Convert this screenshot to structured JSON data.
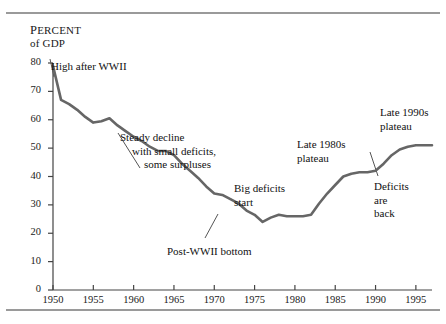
{
  "figure": {
    "axis_title_line1": "Percent",
    "axis_title_line2": "of GDP",
    "line_color": "#666666",
    "rule_color": "#9a9a9a",
    "axis_color": "#444444"
  },
  "chart_data": {
    "type": "line",
    "title": "",
    "subtitle": "",
    "xlabel": "",
    "ylabel": "Percent of GDP",
    "xlim": [
      1950,
      1997
    ],
    "ylim": [
      0,
      80
    ],
    "grid": false,
    "legend": "none",
    "yticks": [
      0,
      10,
      20,
      30,
      40,
      50,
      60,
      70,
      80
    ],
    "ytick_labels": [
      "0",
      "10",
      "20",
      "30",
      "40",
      "50",
      "60",
      "70",
      "80"
    ],
    "xticks": [
      1950,
      1955,
      1960,
      1965,
      1970,
      1975,
      1980,
      1985,
      1990,
      1995
    ],
    "xtick_labels": [
      "1950",
      "1955",
      "1960",
      "1965",
      "1970",
      "1975",
      "1980",
      "1985",
      "1990",
      "1995"
    ],
    "series": [
      {
        "name": "Federal debt held by the public as percent of GDP",
        "x": [
          1950,
          1951,
          1952,
          1953,
          1954,
          1955,
          1956,
          1957,
          1958,
          1959,
          1960,
          1961,
          1962,
          1963,
          1964,
          1965,
          1966,
          1967,
          1968,
          1969,
          1970,
          1971,
          1972,
          1973,
          1974,
          1975,
          1976,
          1977,
          1978,
          1979,
          1980,
          1981,
          1982,
          1983,
          1984,
          1985,
          1986,
          1987,
          1988,
          1989,
          1990,
          1991,
          1992,
          1993,
          1994,
          1995,
          1996,
          1997
        ],
        "values": [
          79.0,
          67.0,
          65.5,
          63.5,
          61.0,
          59.0,
          59.5,
          60.5,
          58.0,
          56.0,
          54.0,
          52.5,
          50.5,
          49.0,
          49.0,
          47.5,
          44.5,
          42.0,
          39.5,
          36.5,
          34.0,
          33.5,
          32.0,
          30.5,
          28.0,
          26.5,
          24.0,
          25.5,
          26.5,
          26.0,
          26.0,
          26.0,
          26.5,
          30.5,
          34.0,
          37.0,
          40.0,
          41.0,
          41.5,
          41.5,
          42.0,
          44.5,
          47.5,
          49.5,
          50.5,
          51.0,
          51.0,
          51.0
        ]
      }
    ],
    "annotations": [
      {
        "id": "high-after-wwii",
        "lines": [
          "High after WWII"
        ],
        "x_px": 51,
        "y_px": 60
      },
      {
        "id": "steady-decline",
        "lines": [
          "Steady decline",
          "with small deficits,",
          "some surpluses"
        ],
        "x_px": 120,
        "y_px": 131
      },
      {
        "id": "post-wwii-bottom",
        "lines": [
          "Post-WWII bottom"
        ],
        "x_px": 167,
        "y_px": 245
      },
      {
        "id": "big-deficits-start",
        "lines": [
          "Big deficits",
          "start"
        ],
        "x_px": 234,
        "y_px": 182
      },
      {
        "id": "late-1980s-plateau",
        "lines": [
          "Late 1980s",
          "plateau"
        ],
        "x_px": 297,
        "y_px": 138
      },
      {
        "id": "late-1990s-plateau",
        "lines": [
          "Late 1990s",
          "plateau"
        ],
        "x_px": 380,
        "y_px": 106
      },
      {
        "id": "deficits-are-back",
        "lines": [
          "Deficits",
          "are",
          "back"
        ],
        "x_px": 374,
        "y_px": 180
      }
    ]
  }
}
